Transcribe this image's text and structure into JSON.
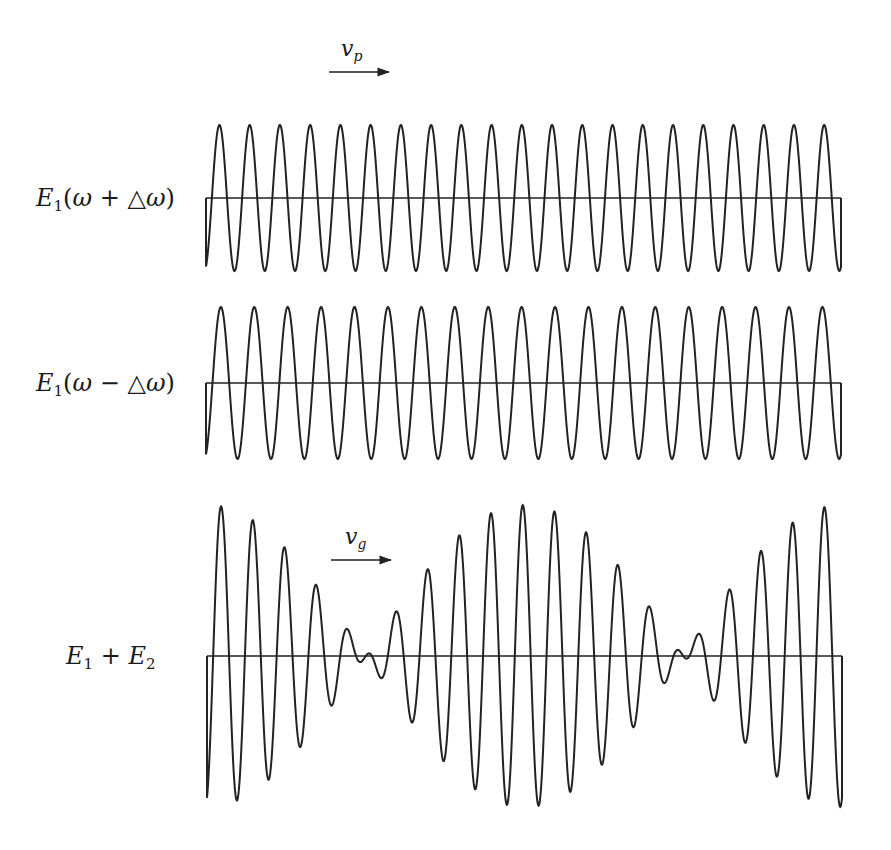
{
  "figure": {
    "stroke_color": "#222222",
    "background": "#ffffff"
  },
  "labels": {
    "wave1": {
      "name": "E",
      "sub": "1",
      "arg_open": "(",
      "omega": "ω",
      "op": " + ",
      "delta": "△",
      "omega2": "ω",
      "arg_close": ")"
    },
    "wave2": {
      "name": "E",
      "sub": "1",
      "arg_open": "(",
      "omega": "ω",
      "op": " − ",
      "delta": "△",
      "omega2": "ω",
      "arg_close": ")"
    },
    "sum": {
      "name1": "E",
      "sub1": "1",
      "op": " + ",
      "name2": "E",
      "sub2": "2"
    }
  },
  "velocities": {
    "phase": {
      "symbol": "v",
      "sub": "p"
    },
    "group": {
      "symbol": "v",
      "sub": "g"
    }
  },
  "waves": [
    {
      "id": "wave-plus",
      "x0": 206,
      "x1": 841,
      "baseline": 198,
      "amplitude": 73,
      "cycles": 21,
      "phase": 0.35
    },
    {
      "id": "wave-minus",
      "x0": 206,
      "x1": 841,
      "baseline": 383,
      "amplitude": 76,
      "cycles": 19,
      "phase": 0.35
    },
    {
      "id": "wave-sum",
      "x0": 207,
      "x1": 842,
      "baseline": 656,
      "amplitude": 151,
      "cycles_a": 21,
      "cycles_b": 19,
      "phase": 0.35
    }
  ],
  "arrows": [
    {
      "id": "arrow-vp",
      "x1": 329,
      "x2": 389,
      "y": 72
    },
    {
      "id": "arrow-vg",
      "x1": 331,
      "x2": 391,
      "y": 560
    }
  ]
}
